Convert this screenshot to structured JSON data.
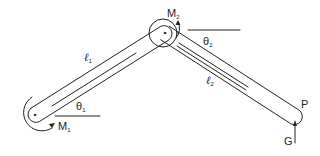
{
  "diagram": {
    "type": "two-link planar manipulator",
    "labels": {
      "link1": {
        "symbol": "ℓ",
        "sub": "1"
      },
      "link2": {
        "symbol": "ℓ",
        "sub": "2"
      },
      "angle1": {
        "symbol": "θ",
        "sub": "1"
      },
      "angle2": {
        "symbol": "θ",
        "sub": "2"
      },
      "moment1": {
        "symbol": "M",
        "sub": "1"
      },
      "moment2": {
        "symbol": "M",
        "sub": "2"
      },
      "endpoint": "P",
      "force": "G"
    },
    "colors": {
      "stroke": "#222222",
      "background": "#ffffff"
    }
  }
}
